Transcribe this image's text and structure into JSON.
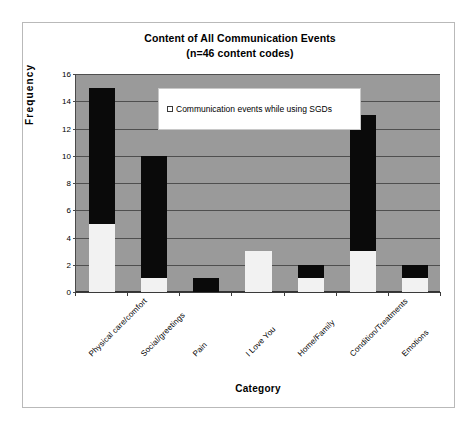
{
  "frame": {
    "border_color": "#b9b9b9"
  },
  "chart_data": {
    "type": "bar",
    "subtype": "stacked-vertical",
    "title": "Content of All Communication Events",
    "subtitle": "(n=46 content codes)",
    "xlabel": "Category",
    "ylabel": "Frequency",
    "ylim": [
      0,
      16
    ],
    "ytick_step": 2,
    "yticks": [
      0,
      2,
      4,
      6,
      8,
      10,
      12,
      14,
      16
    ],
    "ytick_labels": [
      "0",
      "2",
      "4",
      "6",
      "8",
      "10",
      "12",
      "14",
      "16"
    ],
    "grid": true,
    "grid_axis": "y",
    "plot_background": "#9a9a9a",
    "gridline_color": "#4f4f4f",
    "legend_position": "upper-center-inside",
    "categories": [
      "Physical care/comfort",
      "Social/greetings",
      "Pain",
      "I Love You",
      "Home/Family",
      "Condition/Treatments",
      "Emotions"
    ],
    "series": [
      {
        "name": "Communication events while using SGDs",
        "color": "#f2f2f2",
        "values": [
          5,
          1,
          0,
          3,
          1,
          3,
          1
        ]
      },
      {
        "name": "Other communication events",
        "color": "#0a0a0a",
        "values": [
          10,
          9,
          1,
          0,
          1,
          10,
          1
        ]
      }
    ],
    "totals": [
      15,
      10,
      1,
      3,
      2,
      13,
      2
    ]
  },
  "legend": {
    "entries": [
      {
        "label": "Communication events while using SGDs",
        "swatch_fill": "#ffffff",
        "swatch_border": "#3a3a3a"
      }
    ]
  }
}
